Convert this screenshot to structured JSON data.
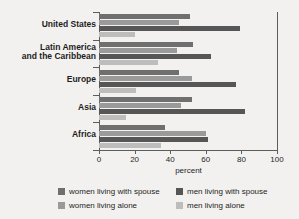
{
  "chart_data": {
    "type": "bar",
    "orientation": "horizontal",
    "title": "",
    "xlabel": "percent",
    "ylabel": "",
    "xlim": [
      0,
      100
    ],
    "xticks": [
      0,
      20,
      40,
      60,
      80,
      100
    ],
    "grid": false,
    "legend_position": "bottom",
    "categories": [
      "United States",
      "Latin America and the Caribbean",
      "Europe",
      "Asia",
      "Africa"
    ],
    "category_labels_display": [
      [
        "United States"
      ],
      [
        "Latin America",
        "and the Caribbean"
      ],
      [
        "Europe"
      ],
      [
        "Asia"
      ],
      [
        "Africa"
      ]
    ],
    "series": [
      {
        "name": "women living with spouse",
        "color": "#6f6f6f",
        "values": [
          51,
          53,
          45,
          52,
          37
        ]
      },
      {
        "name": "women living alone",
        "color": "#9a9a9a",
        "values": [
          45,
          44,
          52,
          46,
          60
        ]
      },
      {
        "name": "men living with spouse",
        "color": "#565656",
        "values": [
          79,
          63,
          77,
          82,
          61
        ]
      },
      {
        "name": "men living alone",
        "color": "#bdbdbd",
        "values": [
          20,
          33,
          21,
          15,
          35
        ]
      }
    ]
  },
  "legend": {
    "entries": [
      {
        "label": "women living with spouse",
        "swatch": "s0"
      },
      {
        "label": "men living with spouse",
        "swatch": "s2"
      },
      {
        "label": "women living alone",
        "swatch": "s1"
      },
      {
        "label": "men living alone",
        "swatch": "s3"
      }
    ]
  },
  "axis": {
    "x_title": "percent",
    "tick_labels": [
      "0",
      "20",
      "40",
      "60",
      "80",
      "100"
    ]
  }
}
